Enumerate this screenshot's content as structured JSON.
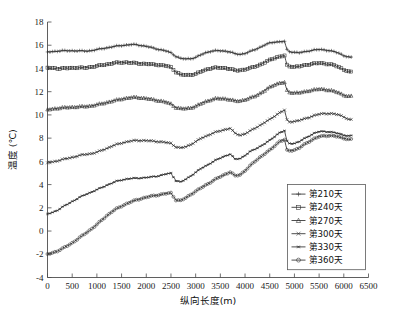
{
  "chart_data": {
    "type": "line",
    "title": "",
    "xlabel": "纵向长度(m)",
    "ylabel": "温度 (℃)",
    "xlim": [
      0,
      6500
    ],
    "ylim": [
      -4,
      18
    ],
    "xticks": [
      0,
      500,
      1000,
      1500,
      2000,
      2500,
      3000,
      3500,
      4000,
      4500,
      5000,
      5500,
      6000,
      6500
    ],
    "yticks": [
      -4,
      -2,
      0,
      2,
      4,
      6,
      8,
      10,
      12,
      14,
      16,
      18
    ],
    "xtick_labels": [
      "0",
      "500",
      "1000",
      "1500",
      "2000",
      "2500",
      "3000",
      "3500",
      "4000",
      "4500",
      "5000",
      "5500",
      "6000",
      "6500"
    ],
    "ytick_labels": [
      "-4",
      "-2",
      "0",
      "2",
      "4",
      "6",
      "8",
      "10",
      "12",
      "14",
      "16",
      "18"
    ],
    "grid": false,
    "legend_position": "lower-right",
    "x": [
      0,
      100,
      200,
      300,
      400,
      500,
      600,
      700,
      800,
      900,
      1000,
      1100,
      1200,
      1300,
      1400,
      1500,
      1600,
      1700,
      1800,
      1900,
      2000,
      2100,
      2200,
      2300,
      2400,
      2500,
      2600,
      2700,
      2800,
      2900,
      3000,
      3100,
      3200,
      3300,
      3400,
      3500,
      3600,
      3700,
      3800,
      3900,
      4000,
      4100,
      4200,
      4300,
      4400,
      4500,
      4600,
      4700,
      4800,
      4850,
      4900,
      5000,
      5100,
      5200,
      5300,
      5400,
      5500,
      5600,
      5700,
      5800,
      5900,
      6000,
      6100,
      6150
    ],
    "series": [
      {
        "name": "第210天",
        "marker": "plus",
        "color": "#3a3a3a",
        "values": [
          15.4,
          15.45,
          15.5,
          15.52,
          15.52,
          15.53,
          15.52,
          15.5,
          15.5,
          15.55,
          15.62,
          15.7,
          15.78,
          15.85,
          15.92,
          15.98,
          16.02,
          16.05,
          16.05,
          15.98,
          15.9,
          15.8,
          15.7,
          15.6,
          15.5,
          15.35,
          15.05,
          14.85,
          14.82,
          14.85,
          14.95,
          15.15,
          15.35,
          15.48,
          15.52,
          15.52,
          15.5,
          15.42,
          15.25,
          15.22,
          15.3,
          15.45,
          15.62,
          15.82,
          16.02,
          16.18,
          16.28,
          16.3,
          16.32,
          15.6,
          15.45,
          15.4,
          15.35,
          15.42,
          15.52,
          15.6,
          15.62,
          15.6,
          15.55,
          15.45,
          15.3,
          15.12,
          14.98,
          14.95
        ]
      },
      {
        "name": "第240天",
        "marker": "square",
        "color": "#3a3a3a",
        "values": [
          14.05,
          14.02,
          14.0,
          14.0,
          14.02,
          14.05,
          14.05,
          14.05,
          14.08,
          14.12,
          14.2,
          14.28,
          14.35,
          14.42,
          14.48,
          14.52,
          14.52,
          14.48,
          14.45,
          14.42,
          14.38,
          14.35,
          14.32,
          14.28,
          14.22,
          14.1,
          13.7,
          13.45,
          13.42,
          13.45,
          13.52,
          13.7,
          13.88,
          14.0,
          14.05,
          14.05,
          14.02,
          13.95,
          13.82,
          13.85,
          13.92,
          14.02,
          14.15,
          14.32,
          14.52,
          14.72,
          14.9,
          15.02,
          15.1,
          14.28,
          14.18,
          14.15,
          14.18,
          14.25,
          14.35,
          14.42,
          14.45,
          14.42,
          14.38,
          14.28,
          14.1,
          13.9,
          13.72,
          13.7
        ]
      },
      {
        "name": "第270天",
        "marker": "triangle",
        "color": "#3a3a3a",
        "values": [
          10.45,
          10.52,
          10.58,
          10.62,
          10.65,
          10.68,
          10.7,
          10.72,
          10.75,
          10.8,
          10.88,
          10.98,
          11.08,
          11.18,
          11.28,
          11.38,
          11.45,
          11.5,
          11.52,
          11.48,
          11.42,
          11.35,
          11.28,
          11.2,
          11.1,
          10.95,
          10.65,
          10.55,
          10.55,
          10.62,
          10.75,
          10.95,
          11.15,
          11.3,
          11.4,
          11.42,
          11.4,
          11.32,
          11.2,
          11.22,
          11.32,
          11.45,
          11.62,
          11.85,
          12.1,
          12.38,
          12.62,
          12.75,
          12.8,
          12.1,
          11.95,
          11.92,
          11.92,
          11.98,
          12.1,
          12.18,
          12.22,
          12.2,
          12.15,
          12.05,
          11.9,
          11.72,
          11.6,
          11.62
        ]
      },
      {
        "name": "第300天",
        "marker": "cross",
        "color": "#3a3a3a",
        "values": [
          5.85,
          5.95,
          6.05,
          6.15,
          6.25,
          6.35,
          6.45,
          6.55,
          6.62,
          6.68,
          6.78,
          6.95,
          7.12,
          7.3,
          7.45,
          7.58,
          7.68,
          7.75,
          7.8,
          7.8,
          7.78,
          7.75,
          7.72,
          7.68,
          7.62,
          7.55,
          7.25,
          7.15,
          7.25,
          7.45,
          7.7,
          7.95,
          8.15,
          8.35,
          8.5,
          8.62,
          8.75,
          8.85,
          8.4,
          8.25,
          8.38,
          8.6,
          8.85,
          9.1,
          9.35,
          9.6,
          9.9,
          10.2,
          10.4,
          9.55,
          9.4,
          9.45,
          9.52,
          9.65,
          9.8,
          9.95,
          10.05,
          10.12,
          10.12,
          10.08,
          10.0,
          9.85,
          9.6,
          9.58
        ]
      },
      {
        "name": "第330天",
        "marker": "asterisk",
        "color": "#3a3a3a",
        "values": [
          1.45,
          1.6,
          1.8,
          2.05,
          2.3,
          2.55,
          2.78,
          3.0,
          3.2,
          3.38,
          3.55,
          3.75,
          3.95,
          4.12,
          4.28,
          4.4,
          4.48,
          4.52,
          4.55,
          4.58,
          4.6,
          4.65,
          4.72,
          4.8,
          4.9,
          4.98,
          4.35,
          4.22,
          4.45,
          4.75,
          5.05,
          5.35,
          5.6,
          5.85,
          6.08,
          6.28,
          6.48,
          6.62,
          6.18,
          6.25,
          6.52,
          6.82,
          7.05,
          7.28,
          7.52,
          7.8,
          8.15,
          8.48,
          8.62,
          7.72,
          7.55,
          7.55,
          7.7,
          7.95,
          8.2,
          8.42,
          8.55,
          8.58,
          8.55,
          8.48,
          8.38,
          8.28,
          8.18,
          8.2
        ]
      },
      {
        "name": "第360天",
        "marker": "circle",
        "color": "#3a3a3a",
        "values": [
          -2.0,
          -1.88,
          -1.72,
          -1.52,
          -1.28,
          -1.02,
          -0.72,
          -0.42,
          -0.1,
          0.22,
          0.55,
          0.95,
          1.32,
          1.65,
          1.92,
          2.15,
          2.35,
          2.52,
          2.68,
          2.8,
          2.9,
          3.0,
          3.08,
          3.15,
          3.22,
          3.28,
          2.68,
          2.62,
          2.85,
          3.15,
          3.42,
          3.68,
          3.95,
          4.2,
          4.45,
          4.68,
          4.9,
          5.08,
          4.75,
          4.85,
          5.2,
          5.6,
          6.0,
          6.35,
          6.65,
          6.95,
          7.35,
          7.72,
          7.85,
          6.95,
          6.92,
          6.98,
          7.15,
          7.45,
          7.72,
          7.95,
          8.12,
          8.2,
          8.22,
          8.18,
          8.1,
          8.0,
          7.88,
          7.9
        ]
      }
    ]
  },
  "legend": {
    "entries": [
      {
        "label": "第210天",
        "marker": "plus"
      },
      {
        "label": "第240天",
        "marker": "square"
      },
      {
        "label": "第270天",
        "marker": "triangle"
      },
      {
        "label": "第300天",
        "marker": "cross"
      },
      {
        "label": "第330天",
        "marker": "asterisk"
      },
      {
        "label": "第360天",
        "marker": "circle"
      }
    ]
  },
  "colors": {
    "axis": "#4d4d4d",
    "line": "#3a3a3a",
    "background": "#ffffff",
    "text": "#101010"
  }
}
